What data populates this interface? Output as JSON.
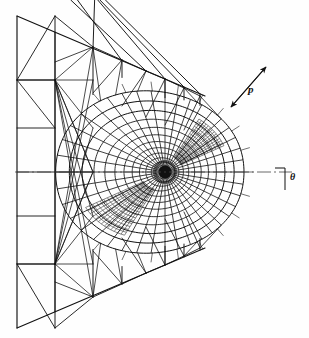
{
  "figure": {
    "name": "finite-element-mesh-crack-tip",
    "kind": "engineering-diagram",
    "background_color": "#fefefe",
    "line_color": "#111111",
    "width": 309,
    "height": 338
  },
  "labels": {
    "load_label": "p",
    "angle_label": "θ"
  },
  "annotations": {
    "load_arrow": {
      "name": "load-arrow",
      "double_headed": true,
      "x1": 231,
      "y1": 107,
      "x2": 266,
      "y2": 67
    },
    "angle_tick": {
      "name": "angle-tick-mark",
      "x": 285,
      "y_top": 168,
      "y_bottom": 190
    },
    "axis_line": {
      "name": "horizontal-axis-centerline",
      "style": "dash-dot",
      "x1": 15,
      "y1": 172,
      "x2": 292,
      "y2": 172
    }
  },
  "chart_data": {
    "type": "mesh",
    "title": "",
    "xlabel": "",
    "ylabel": "",
    "center": {
      "x": 165,
      "y": 172
    },
    "outer_boundary": [
      [
        17,
        16
      ],
      [
        17,
        328
      ],
      [
        230,
        246
      ],
      [
        244,
        172
      ],
      [
        230,
        98
      ]
    ],
    "polar_mesh": {
      "ray_count": 40,
      "ring_radii": [
        3,
        6,
        10,
        15,
        21,
        28,
        36,
        45,
        55,
        66,
        78,
        91,
        105,
        120
      ],
      "angular_span_deg": [
        -180,
        180
      ],
      "boundary_radius_right": 79,
      "boundary_radius_left": 112
    },
    "refined_bands": [
      {
        "name": "upper-left-crack-band",
        "angle_deg": 138,
        "density": "high"
      },
      {
        "name": "lower-right-crack-band",
        "angle_deg": -42,
        "density": "high"
      }
    ],
    "outer_mesh": {
      "columns": 7,
      "rows": 10,
      "element_types": [
        "quad",
        "triangle"
      ]
    },
    "legend": [],
    "grid": false
  }
}
